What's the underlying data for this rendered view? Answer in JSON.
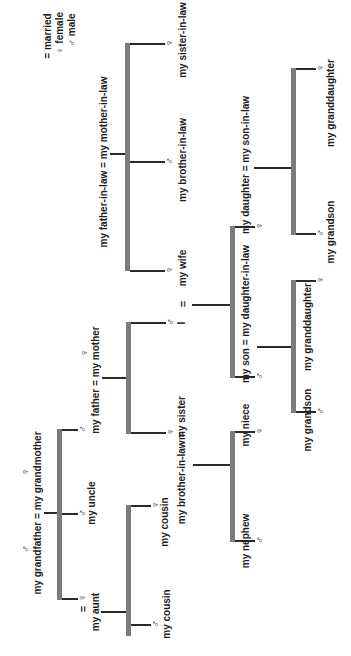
{
  "legend": {
    "married": {
      "symbol": "=",
      "label": "married"
    },
    "female": {
      "symbol": "♀",
      "label": "female"
    },
    "male": {
      "symbol": "♂",
      "label": "male"
    }
  },
  "symbols": {
    "female": "♀",
    "male": "♂",
    "married": "="
  },
  "people": {
    "grandparents": "my grandfather = my grandmother",
    "father_mother": "my father = my mother",
    "uncle": "my uncle",
    "aunt": "my aunt",
    "cousin_1": "my cousin",
    "cousin_2": "my cousin",
    "sister": "my sister",
    "brother_in_law_sister": "my brother-in-law =",
    "niece": "my niece",
    "nephew": "my nephew",
    "self": "I",
    "wife": "my wife",
    "in_law_parents": "my father-in-law = my mother-in-law",
    "brother_in_law": "my brother-in-law",
    "sister_in_law": "my sister-in-law",
    "son_couple": "my son = my daughter-in-law",
    "daughter_couple": "my daughter = my son-in-law",
    "son_grandson": "my grandson",
    "son_granddaughter": "my granddaughter",
    "daughter_grandson": "my grandson",
    "daughter_granddaughter": "my granddaughter"
  },
  "colors": {
    "bar": "#7b7b7b",
    "line": "#2a2a2a",
    "text": "#1e1e1e",
    "background": "#ffffff"
  }
}
